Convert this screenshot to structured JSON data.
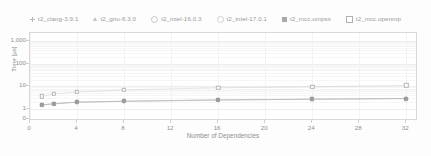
{
  "chart_data": {
    "type": "scatter",
    "title": "",
    "xlabel": "Number of Dependencies",
    "ylabel": "Time [us]",
    "ylabel_display": "Time [µs]",
    "yscale": "log",
    "xlim": [
      0,
      33
    ],
    "ylim_labels": [
      "0",
      "1",
      "10",
      "100",
      "1,000"
    ],
    "xticks": [
      0,
      4,
      8,
      12,
      16,
      20,
      24,
      28,
      32
    ],
    "xtick_labels": [
      "0",
      "4",
      "8",
      "12",
      "16",
      "20",
      "24",
      "28",
      "32"
    ],
    "yticks": [
      0,
      1,
      10,
      100,
      1000
    ],
    "ytick_labels": [
      "0",
      "1",
      "10",
      "100",
      "1,000"
    ],
    "grid": true,
    "legend_position": "top",
    "x": [
      1,
      2,
      4,
      8,
      16,
      24,
      32
    ],
    "series": [
      {
        "name": "t2_clang-3.9.1",
        "marker": "plus",
        "color": "#bcbcbc",
        "values": [
          1.5,
          1.7,
          2.0,
          2.2,
          2.5,
          2.7,
          2.9
        ]
      },
      {
        "name": "t2_gnu-6.3.0",
        "marker": "triangle-open",
        "color": "#c3c3c3",
        "values": [
          1.5,
          1.7,
          2.0,
          2.2,
          2.5,
          2.7,
          2.9
        ]
      },
      {
        "name": "t2_intel-16.0.3",
        "marker": "circle-open",
        "color": "#bdbdbd",
        "values": [
          1.5,
          1.7,
          2.0,
          2.2,
          2.5,
          2.7,
          2.9
        ]
      },
      {
        "name": "t2_intel-17.0.1",
        "marker": "circle-open",
        "color": "#cccccc",
        "values": [
          1.5,
          1.7,
          2.0,
          2.2,
          2.5,
          2.7,
          2.9
        ]
      },
      {
        "name": "t2_mcc.ompss",
        "marker": "square-filled",
        "color": "#9b9b9b",
        "values": [
          1.5,
          1.7,
          2.0,
          2.2,
          2.5,
          2.7,
          2.9
        ]
      },
      {
        "name": "t2_mcc.openmp",
        "marker": "square-open",
        "color": "#b4b4b4",
        "values": [
          3.6,
          4.6,
          5.6,
          7.0,
          8.6,
          9.6,
          11.0
        ]
      }
    ]
  },
  "legend": {
    "items": [
      {
        "label": "t2_clang-3.9.1",
        "marker": "plus-icon"
      },
      {
        "label": "t2_gnu-6.3.0",
        "marker": "triangle-open-icon"
      },
      {
        "label": "t2_intel-16.0.3",
        "marker": "circle-open-icon"
      },
      {
        "label": "t2_intel-17.0.1",
        "marker": "circle-open-icon"
      },
      {
        "label": "t2_mcc.ompss",
        "marker": "square-filled-icon"
      },
      {
        "label": "t2_mcc.openmp",
        "marker": "square-open-icon"
      }
    ]
  },
  "axes": {
    "y_title": "Time [µs]",
    "x_title": "Number of Dependencies",
    "y_labels": [
      "1,000",
      "100",
      "10",
      "1",
      "0"
    ],
    "x_labels": [
      "0",
      "4",
      "8",
      "12",
      "16",
      "20",
      "24",
      "28",
      "32"
    ]
  }
}
